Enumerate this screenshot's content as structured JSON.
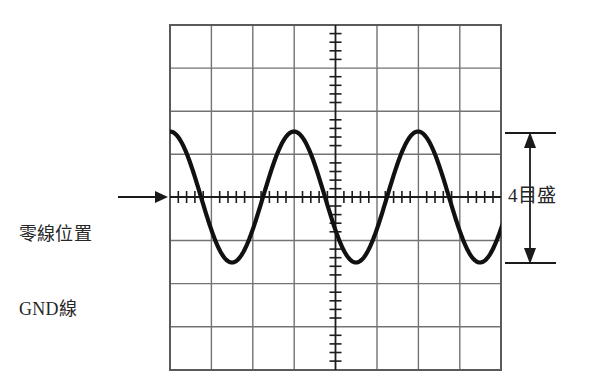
{
  "figure": {
    "title_hidden": "",
    "type": "oscilloscope-graticule-with-sine-waveform",
    "background_color": "#ffffff",
    "grid": {
      "line_color": "#707070",
      "border_color": "#5a5a5a",
      "x_left": 170,
      "x_right": 501,
      "y_top": 25,
      "y_bottom": 370,
      "columns": 8,
      "rows": 8,
      "division_width_px": 41.4,
      "division_height_px": 43.1,
      "grid_on": true
    },
    "center_axes": {
      "horizontal_y": 197,
      "vertical_x": 335.5,
      "minor_ticks_per_division": 5,
      "tick_color": "#1c1c1c"
    },
    "waveform": {
      "color": "#111111",
      "stroke_width": 4,
      "shape": "sine",
      "amplitude_divisions": 2,
      "peak_to_peak_divisions": 4,
      "cycles_visible": 3,
      "period_px": 124,
      "phase_start": "trough-at-left-edge",
      "center_y": 197,
      "peak_y": 132,
      "trough_y": 263,
      "peak_x_positions": [
        213,
        337,
        444
      ],
      "trough_x_positions": [
        277,
        382,
        495
      ]
    }
  },
  "annotations": {
    "gnd": {
      "line1": "零線位置",
      "line2": "GND線",
      "arrow": {
        "direction": "right",
        "from_x": 118,
        "to_x": 162,
        "y": 197,
        "color": "#1a1a1a"
      }
    },
    "amplitude": {
      "text": "4目盛",
      "arrow": {
        "direction": "double-vertical",
        "x": 530,
        "top_y": 133,
        "bottom_y": 263,
        "tie_line_left_x": 505,
        "tie_line_right_x": 555,
        "color": "#1a1a1a"
      }
    }
  },
  "colors": {
    "ink": "#262626",
    "waveform": "#111111",
    "grid": "#707070",
    "paper": "#ffffff"
  }
}
